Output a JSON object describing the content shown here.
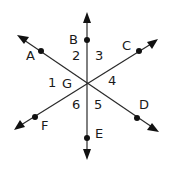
{
  "diagram": {
    "center": {
      "label": "G"
    },
    "points": {
      "A": "A",
      "B": "B",
      "C": "C",
      "D": "D",
      "E": "E",
      "F": "F"
    },
    "angles": [
      "1",
      "2",
      "3",
      "4",
      "5",
      "6"
    ],
    "lines": [
      {
        "name": "line-BE",
        "through": [
          "B",
          "E"
        ]
      },
      {
        "name": "line-AD",
        "through": [
          "A",
          "D"
        ]
      },
      {
        "name": "line-CF",
        "through": [
          "C",
          "F"
        ]
      }
    ]
  }
}
